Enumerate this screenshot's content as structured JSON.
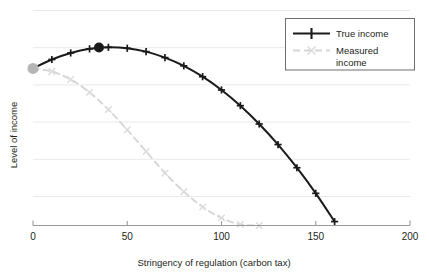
{
  "chart_data": {
    "type": "line",
    "title": "",
    "subtitle": "",
    "xlabel": "Stringency of regulation (carbon tax)",
    "ylabel": "Level of income",
    "xlim": [
      0,
      200
    ],
    "ylim": [
      0,
      1.15
    ],
    "xticks": [
      0,
      50,
      100,
      150,
      200
    ],
    "xticklabels": [
      "0",
      "50",
      "100",
      "150",
      "200"
    ],
    "yticks": [],
    "yticklabels": [],
    "grid": "horizontal",
    "legend_position": "top-right",
    "series": [
      {
        "name": "True income",
        "color": "#1a1a1a",
        "linestyle": "solid",
        "marker": "plus",
        "x": [
          0,
          10,
          20,
          30,
          40,
          50,
          60,
          70,
          80,
          90,
          100,
          110,
          120,
          130,
          140,
          150,
          160
        ],
        "values": [
          0.84,
          0.888,
          0.923,
          0.945,
          0.953,
          0.948,
          0.93,
          0.898,
          0.854,
          0.796,
          0.725,
          0.641,
          0.543,
          0.433,
          0.309,
          0.172,
          0.021
        ]
      },
      {
        "name": "Measured income",
        "color": "#d6d6d6",
        "linestyle": "dashed",
        "marker": "x",
        "x": [
          0,
          10,
          20,
          30,
          40,
          50,
          60,
          70,
          80,
          90,
          100,
          110,
          120
        ],
        "values": [
          0.84,
          0.824,
          0.781,
          0.712,
          0.62,
          0.512,
          0.396,
          0.281,
          0.181,
          0.099,
          0.04,
          0.006,
          0.0
        ]
      }
    ],
    "annotations": [
      {
        "name": "laissez-faire-point",
        "kind": "dot",
        "x": 0,
        "y": 0.84,
        "color": "#b5b5b5",
        "radius": 5.5
      },
      {
        "name": "optimum-point",
        "kind": "dot",
        "x": 35,
        "y": 0.952,
        "color": "#1a1a1a",
        "radius": 5.0
      }
    ]
  },
  "legend": {
    "entries": [
      {
        "label": "True income",
        "swatch": "solid-plus-black"
      },
      {
        "label": "Measured income",
        "swatch": "dashed-x-gray"
      }
    ]
  },
  "axes": {
    "x_label": "Stringency of regulation (carbon tax)",
    "y_label": "Level of income",
    "x_tick_labels": [
      "0",
      "50",
      "100",
      "150",
      "200"
    ]
  }
}
